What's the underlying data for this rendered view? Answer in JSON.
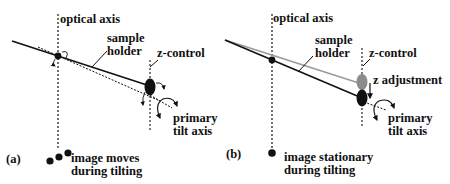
{
  "colors": {
    "ink": "#111111",
    "gray_line": "#9a9a9a",
    "gray_control": "#8c8c8c",
    "background": "#ffffff"
  },
  "panel_a": {
    "tag": "(a)",
    "optical_axis_label": "optical axis",
    "sample_holder_label_line1": "sample",
    "sample_holder_label_line2": "holder",
    "z_control_label": "z-control",
    "tilt_axis_label_line1": "primary",
    "tilt_axis_label_line2": "tilt axis",
    "image_label_line1": "image moves",
    "image_label_line2": "during tilting"
  },
  "panel_b": {
    "tag": "(b)",
    "optical_axis_label": "optical axis",
    "sample_holder_label_line1": "sample",
    "sample_holder_label_line2": "holder",
    "z_control_label": "z-control",
    "z_adjustment_label": "z adjustment",
    "tilt_axis_label_line1": "primary",
    "tilt_axis_label_line2": "tilt axis",
    "image_label_line1": "image stationary",
    "image_label_line2": "during tilting"
  }
}
